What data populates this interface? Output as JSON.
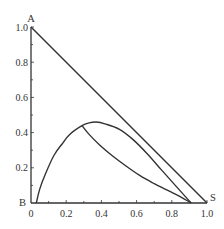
{
  "chart_data": {
    "type": "line",
    "title": "",
    "xlabel": "",
    "ylabel": "",
    "xlim": [
      0,
      1.0
    ],
    "ylim": [
      0,
      1.0
    ],
    "grid": false,
    "legend": null,
    "x_ticks": [
      0,
      0.2,
      0.4,
      0.6,
      0.8,
      1.0
    ],
    "x_tick_labels": [
      "0",
      "0.2",
      "0.4",
      "0.6",
      "0.8",
      "1.0"
    ],
    "y_ticks": [
      0.2,
      0.4,
      0.6,
      0.8,
      1.0
    ],
    "y_tick_labels": [
      "0.2",
      "0.4",
      "0.6",
      "0.8",
      "1.0"
    ],
    "vertex_labels": [
      {
        "label": "A",
        "x": 0,
        "y": 1.0
      },
      {
        "label": "B",
        "x": 0,
        "y": 0
      },
      {
        "label": "S",
        "x": 1.0,
        "y": 0
      }
    ],
    "series": [
      {
        "name": "hypotenuse A-S",
        "x": [
          0,
          1.0
        ],
        "y": [
          1.0,
          0
        ]
      },
      {
        "name": "binodal curve",
        "x": [
          0.03,
          0.05,
          0.08,
          0.13,
          0.18,
          0.22,
          0.29,
          0.33,
          0.37,
          0.42,
          0.5,
          0.58,
          0.66,
          0.74,
          0.82,
          0.91
        ],
        "y": [
          0.0,
          0.08,
          0.16,
          0.27,
          0.34,
          0.39,
          0.44,
          0.455,
          0.46,
          0.45,
          0.42,
          0.36,
          0.28,
          0.19,
          0.1,
          0.0
        ]
      },
      {
        "name": "inner curve from plait point",
        "x": [
          0.29,
          0.33,
          0.39,
          0.46,
          0.54,
          0.62,
          0.7,
          0.78,
          0.85,
          0.91
        ],
        "y": [
          0.44,
          0.39,
          0.33,
          0.27,
          0.21,
          0.155,
          0.11,
          0.07,
          0.035,
          0.0
        ]
      }
    ]
  }
}
